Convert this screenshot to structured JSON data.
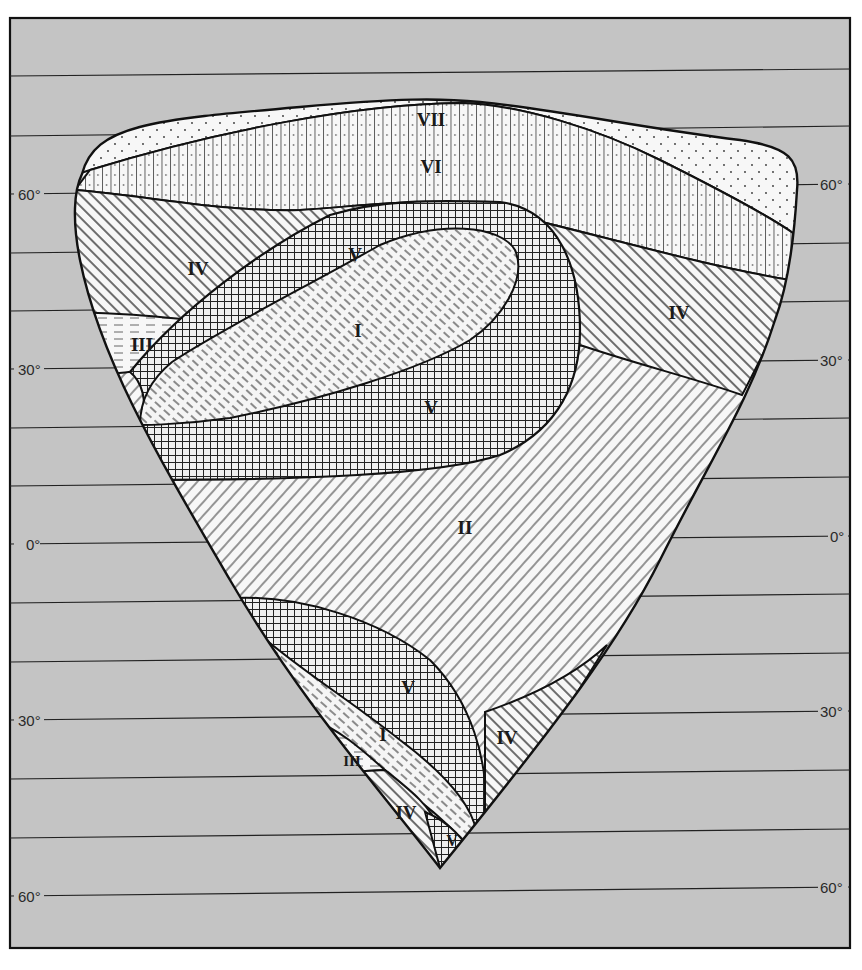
{
  "figure": {
    "type": "zonal diagram of idealized continent",
    "background_color": "#c4c4c4",
    "continent_fill": "#f4f4f4",
    "line_color": "#1a1a1a"
  },
  "latitudes": {
    "left_labels": [
      {
        "label": "60°",
        "y": 194
      },
      {
        "label": "30°",
        "y": 369
      },
      {
        "label": "0°",
        "y": 544
      },
      {
        "label": "30°",
        "y": 720
      },
      {
        "label": "60°",
        "y": 896
      }
    ],
    "right_labels": [
      {
        "label": "60°",
        "y": 184
      },
      {
        "label": "30°",
        "y": 360
      },
      {
        "label": "0°",
        "y": 536
      },
      {
        "label": "30°",
        "y": 711
      },
      {
        "label": "60°",
        "y": 887
      }
    ],
    "gridline_interval_deg": 10
  },
  "zones": [
    {
      "id": "VII",
      "label": "VII",
      "pattern": "sparse dots",
      "x": 431,
      "y": 119
    },
    {
      "id": "VI",
      "label": "VI",
      "pattern": "vertical lines with dots",
      "x": 431,
      "y": 166
    },
    {
      "id": "IV-nw",
      "label": "IV",
      "pattern": "diagonal hatching (\\)",
      "x": 198,
      "y": 268
    },
    {
      "id": "IV-ne",
      "label": "IV",
      "pattern": "diagonal hatching (\\)",
      "x": 679,
      "y": 312
    },
    {
      "id": "V-n1",
      "label": "V",
      "pattern": "cross-hatch grid",
      "x": 355,
      "y": 254
    },
    {
      "id": "I-n",
      "label": "I",
      "pattern": "dashed diagonal hatching",
      "x": 358,
      "y": 330
    },
    {
      "id": "III-nw",
      "label": "III",
      "pattern": "horizontal dashes",
      "x": 142,
      "y": 344
    },
    {
      "id": "V-n2",
      "label": "V",
      "pattern": "cross-hatch grid",
      "x": 431,
      "y": 407
    },
    {
      "id": "II",
      "label": "II",
      "pattern": "diagonal hatching (/)",
      "x": 465,
      "y": 527
    },
    {
      "id": "V-s1",
      "label": "V",
      "pattern": "cross-hatch grid",
      "x": 408,
      "y": 687
    },
    {
      "id": "I-s",
      "label": "I",
      "pattern": "dashed diagonal hatching",
      "x": 383,
      "y": 734
    },
    {
      "id": "IV-se",
      "label": "IV",
      "pattern": "diagonal hatching (\\)",
      "x": 507,
      "y": 737
    },
    {
      "id": "III-sw",
      "label": "III",
      "pattern": "horizontal dashes",
      "x": 352,
      "y": 760
    },
    {
      "id": "IV-sw",
      "label": "IV",
      "pattern": "diagonal hatching (\\)",
      "x": 406,
      "y": 812
    },
    {
      "id": "V-s2",
      "label": "V",
      "pattern": "cross-hatch grid",
      "x": 452,
      "y": 840
    }
  ]
}
